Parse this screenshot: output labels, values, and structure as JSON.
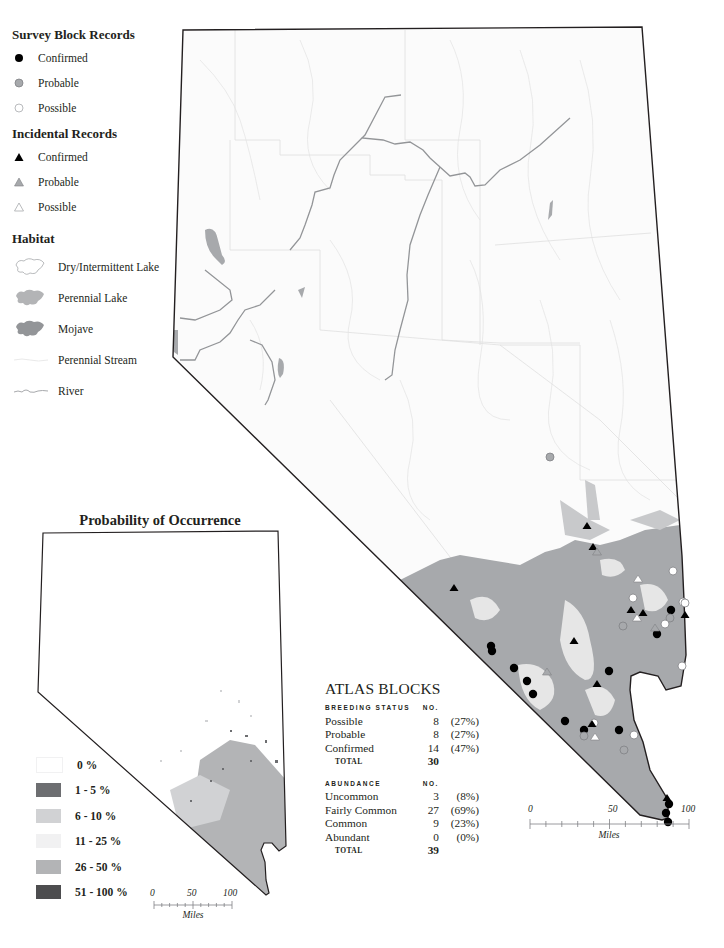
{
  "legend": {
    "survey_block": {
      "title": "Survey Block Records",
      "items": [
        {
          "label": "Confirmed",
          "icon": "filled-black-circle"
        },
        {
          "label": "Probable",
          "icon": "gray-circle"
        },
        {
          "label": "Possible",
          "icon": "hollow-circle"
        }
      ]
    },
    "incidental": {
      "title": "Incidental Records",
      "items": [
        {
          "label": "Confirmed",
          "icon": "filled-black-triangle"
        },
        {
          "label": "Probable",
          "icon": "gray-triangle"
        },
        {
          "label": "Possible",
          "icon": "hollow-triangle"
        }
      ]
    },
    "habitat": {
      "title": "Habitat",
      "items": [
        {
          "label": "Dry/Intermittent Lake",
          "icon": "dry-lake-shape"
        },
        {
          "label": "Perennial Lake",
          "icon": "perennial-lake-shape"
        },
        {
          "label": "Mojave",
          "icon": "mojave-shape"
        },
        {
          "label": "Perennial Stream",
          "icon": "stream-line"
        },
        {
          "label": "River",
          "icon": "river-line"
        }
      ]
    }
  },
  "probability_map": {
    "title": "Probability of Occurrence",
    "classes": [
      {
        "label": "0 %",
        "color": "#ffffff"
      },
      {
        "label": "1 - 5 %",
        "color": "#6d6e71"
      },
      {
        "label": "6 - 10 %",
        "color": "#d1d2d4"
      },
      {
        "label": "11 - 25 %",
        "color": "#f1f1f2"
      },
      {
        "label": "26 - 50 %",
        "color": "#b3b4b6"
      },
      {
        "label": "51 - 100 %",
        "color": "#4d4d4f"
      }
    ],
    "scale": {
      "ticks": [
        "0",
        "50",
        "100"
      ],
      "unit": "Miles"
    }
  },
  "main_map": {
    "scale": {
      "ticks": [
        "0",
        "50",
        "100"
      ],
      "unit": "Miles"
    },
    "colors": {
      "mojave": "#a7a9ac",
      "background": "#fbfbfb",
      "border": "#231f20",
      "river": "#939598",
      "lake": "#a7a9ac"
    }
  },
  "atlas_blocks": {
    "title": "ATLAS BLOCKS",
    "breeding_status": {
      "header": "BREEDING STATUS",
      "no_header": "NO.",
      "rows": [
        {
          "label": "Possible",
          "no": "8",
          "pct": "(27%)"
        },
        {
          "label": "Probable",
          "no": "8",
          "pct": "(27%)"
        },
        {
          "label": "Confirmed",
          "no": "14",
          "pct": "(47%)"
        }
      ],
      "total_label": "TOTAL",
      "total": "30"
    },
    "abundance": {
      "header": "ABUNDANCE",
      "no_header": "NO.",
      "rows": [
        {
          "label": "Uncommon",
          "no": "3",
          "pct": "(8%)"
        },
        {
          "label": "Fairly Common",
          "no": "27",
          "pct": "(69%)"
        },
        {
          "label": "Common",
          "no": "9",
          "pct": "(23%)"
        },
        {
          "label": "Abundant",
          "no": "0",
          "pct": "(0%)"
        }
      ],
      "total_label": "TOTAL",
      "total": "39"
    }
  }
}
